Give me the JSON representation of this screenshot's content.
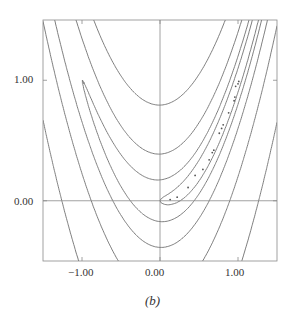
{
  "chart_data": {
    "type": "contour",
    "title": "",
    "caption": "(b)",
    "function": "rosenbrock: 100*(y - x^2)^2 + (1 - x)^2",
    "xlim": [
      -1.5,
      1.5
    ],
    "ylim": [
      -0.5,
      1.5
    ],
    "x_ticks": [
      -1.0,
      0.0,
      1.0
    ],
    "x_tick_labels": [
      "−1.00",
      "0.00",
      "1.00"
    ],
    "y_ticks": [
      0.0,
      1.0
    ],
    "y_tick_labels": [
      "0.00",
      "1.00"
    ],
    "axis_lines": {
      "x0": true,
      "y0": true
    },
    "contour_levels": [
      1,
      4,
      16,
      64,
      256,
      1024
    ],
    "iterate_path": [
      [
        0.13,
        0.01
      ],
      [
        0.22,
        0.03
      ],
      [
        0.36,
        0.11
      ],
      [
        0.45,
        0.21
      ],
      [
        0.55,
        0.26
      ],
      [
        0.63,
        0.34
      ],
      [
        0.67,
        0.4
      ],
      [
        0.69,
        0.42
      ],
      [
        0.76,
        0.56
      ],
      [
        0.79,
        0.6
      ],
      [
        0.81,
        0.63
      ],
      [
        0.88,
        0.73
      ],
      [
        0.95,
        0.83
      ],
      [
        0.96,
        0.86
      ],
      [
        0.97,
        0.95
      ],
      [
        1.0,
        0.97
      ],
      [
        1.01,
        0.99
      ]
    ],
    "colors": {
      "line": "#6f6f6f",
      "frame": "#8a8a8a",
      "marker": "#555555"
    }
  }
}
